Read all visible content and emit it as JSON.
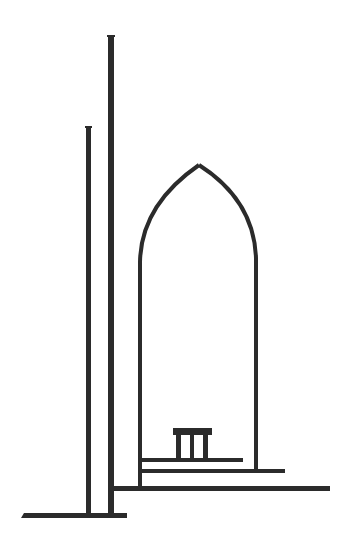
{
  "illustration": {
    "subject": "minimalist line drawing of a gothic arch doorway with two tall poles and a small bench on stepped platforms",
    "colors": {
      "ink": "#2b2b2b",
      "background": "#ffffff"
    },
    "elements": {
      "tall_pole": {
        "x": 108,
        "y": 35,
        "w": 6,
        "h": 482
      },
      "short_pole": {
        "x": 86,
        "y": 126,
        "w": 5,
        "h": 391
      },
      "base_line": {
        "x": 22,
        "y": 513,
        "w": 105,
        "h": 5
      },
      "arch": {
        "left_x": 140,
        "right_x": 256,
        "apex_x": 199,
        "apex_y": 164,
        "spring_y": 255,
        "left_bottom_y": 488,
        "right_bottom_y": 472
      },
      "steps": [
        {
          "x": 142,
          "y": 458,
          "w": 101,
          "h": 4
        },
        {
          "x": 142,
          "y": 469,
          "w": 143,
          "h": 4
        },
        {
          "x": 113,
          "y": 486,
          "w": 217,
          "h": 5
        }
      ],
      "bench": {
        "x": 173,
        "y": 428,
        "w": 39,
        "top_h": 7,
        "legs": 3,
        "bottom_y": 459
      }
    }
  }
}
